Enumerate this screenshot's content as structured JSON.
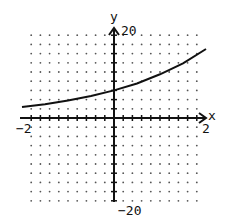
{
  "chart_data": {
    "type": "line",
    "title": "",
    "xlabel": "x",
    "ylabel": "y",
    "xlim": [
      -2,
      2
    ],
    "ylim": [
      -20,
      20
    ],
    "x_tick_step": 0.222,
    "y_tick_step": 2,
    "grid": "dots",
    "tick_labels": {
      "x_min": "−2",
      "x_max": "2",
      "y_min": "−20",
      "y_max": "20"
    },
    "series": [
      {
        "name": "curve",
        "x": [
          -2,
          -1.5,
          -1,
          -0.5,
          0,
          0.5,
          1,
          1.5,
          2
        ],
        "y": [
          2.4,
          3.0,
          3.8,
          4.8,
          6.0,
          7.5,
          9.5,
          11.9,
          15.0
        ]
      }
    ]
  },
  "labels": {
    "x_axis": "x",
    "y_axis": "y",
    "x_min": "−2",
    "x_max": "2",
    "y_max": "20",
    "y_min": "−20"
  }
}
